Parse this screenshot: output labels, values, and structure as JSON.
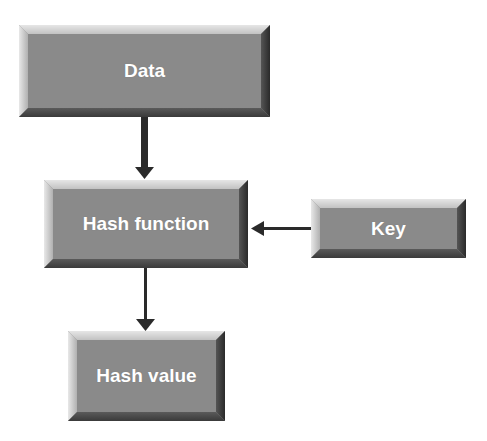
{
  "diagram": {
    "nodes": [
      {
        "id": "data",
        "label": "Data"
      },
      {
        "id": "hash_function",
        "label": "Hash function"
      },
      {
        "id": "key",
        "label": "Key"
      },
      {
        "id": "hash_value",
        "label": "Hash value"
      }
    ],
    "edges": [
      {
        "from": "data",
        "to": "hash_function"
      },
      {
        "from": "key",
        "to": "hash_function"
      },
      {
        "from": "hash_function",
        "to": "hash_value"
      }
    ],
    "colors": {
      "box_face": "#8a8a8a",
      "box_text": "#ffffff",
      "arrow": "#2a2a2a",
      "background": "#ffffff"
    }
  }
}
